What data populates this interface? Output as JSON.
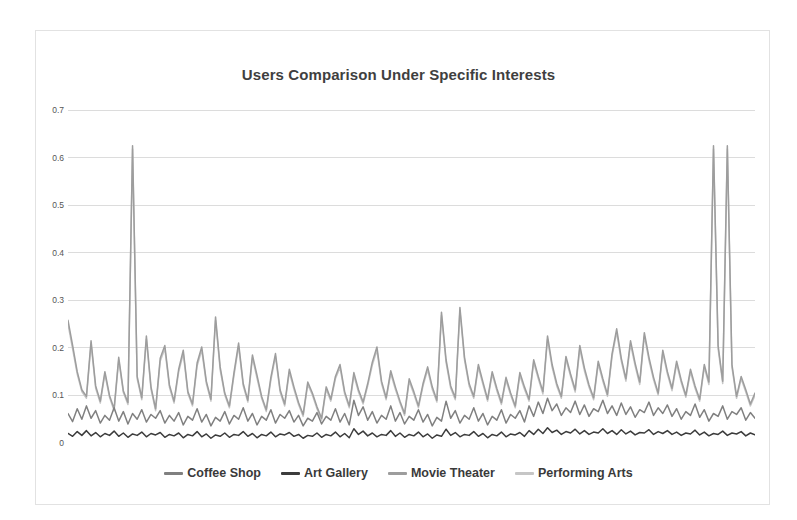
{
  "chart_data": {
    "type": "line",
    "title": "Users Comparison Under Specific Interests",
    "xlabel": "",
    "ylabel": "",
    "ylim": [
      0,
      0.7
    ],
    "yticks": [
      0,
      0.1,
      0.2,
      0.3,
      0.4,
      0.5,
      0.6,
      0.7
    ],
    "ytick_labels": [
      "0",
      "0.1",
      "0.2",
      "0.3",
      "0.4",
      "0.5",
      "0.6",
      "0.7"
    ],
    "grid": true,
    "legend_position": "bottom",
    "x_axis_visible": false,
    "n_points": 150,
    "series": [
      {
        "name": "Coffee Shop",
        "color": "#808080",
        "values": [
          0.062,
          0.045,
          0.072,
          0.05,
          0.078,
          0.052,
          0.068,
          0.042,
          0.058,
          0.048,
          0.074,
          0.046,
          0.066,
          0.04,
          0.062,
          0.05,
          0.07,
          0.044,
          0.06,
          0.052,
          0.068,
          0.042,
          0.058,
          0.046,
          0.064,
          0.038,
          0.056,
          0.048,
          0.072,
          0.044,
          0.06,
          0.036,
          0.054,
          0.046,
          0.066,
          0.04,
          0.058,
          0.05,
          0.074,
          0.046,
          0.062,
          0.038,
          0.056,
          0.048,
          0.07,
          0.042,
          0.06,
          0.052,
          0.068,
          0.044,
          0.058,
          0.036,
          0.052,
          0.046,
          0.064,
          0.04,
          0.056,
          0.048,
          0.072,
          0.044,
          0.062,
          0.038,
          0.09,
          0.058,
          0.076,
          0.048,
          0.066,
          0.042,
          0.058,
          0.05,
          0.078,
          0.046,
          0.064,
          0.04,
          0.056,
          0.048,
          0.07,
          0.044,
          0.06,
          0.036,
          0.054,
          0.046,
          0.088,
          0.052,
          0.068,
          0.042,
          0.058,
          0.05,
          0.074,
          0.046,
          0.062,
          0.038,
          0.056,
          0.048,
          0.07,
          0.042,
          0.06,
          0.052,
          0.068,
          0.044,
          0.078,
          0.056,
          0.086,
          0.062,
          0.094,
          0.068,
          0.082,
          0.058,
          0.074,
          0.064,
          0.088,
          0.06,
          0.08,
          0.056,
          0.072,
          0.066,
          0.09,
          0.062,
          0.078,
          0.058,
          0.084,
          0.06,
          0.076,
          0.054,
          0.07,
          0.064,
          0.086,
          0.058,
          0.074,
          0.062,
          0.08,
          0.056,
          0.072,
          0.05,
          0.066,
          0.058,
          0.082,
          0.054,
          0.07,
          0.046,
          0.062,
          0.056,
          0.078,
          0.05,
          0.066,
          0.06,
          0.074,
          0.048,
          0.064,
          0.052
        ]
      },
      {
        "name": "Art Gallery",
        "color": "#3c3c3c",
        "values": [
          0.02,
          0.014,
          0.024,
          0.016,
          0.026,
          0.015,
          0.022,
          0.013,
          0.02,
          0.016,
          0.025,
          0.014,
          0.021,
          0.012,
          0.019,
          0.016,
          0.023,
          0.013,
          0.02,
          0.017,
          0.022,
          0.012,
          0.018,
          0.015,
          0.021,
          0.011,
          0.018,
          0.015,
          0.024,
          0.013,
          0.019,
          0.01,
          0.017,
          0.014,
          0.021,
          0.012,
          0.018,
          0.016,
          0.024,
          0.014,
          0.02,
          0.011,
          0.018,
          0.015,
          0.023,
          0.013,
          0.019,
          0.017,
          0.022,
          0.014,
          0.018,
          0.01,
          0.016,
          0.014,
          0.021,
          0.012,
          0.018,
          0.015,
          0.023,
          0.013,
          0.02,
          0.011,
          0.03,
          0.018,
          0.025,
          0.015,
          0.021,
          0.013,
          0.018,
          0.016,
          0.026,
          0.014,
          0.021,
          0.012,
          0.018,
          0.015,
          0.023,
          0.013,
          0.019,
          0.01,
          0.017,
          0.014,
          0.029,
          0.016,
          0.022,
          0.013,
          0.018,
          0.016,
          0.024,
          0.014,
          0.02,
          0.011,
          0.018,
          0.015,
          0.023,
          0.013,
          0.019,
          0.017,
          0.022,
          0.014,
          0.026,
          0.018,
          0.029,
          0.02,
          0.032,
          0.022,
          0.027,
          0.018,
          0.024,
          0.021,
          0.029,
          0.019,
          0.026,
          0.018,
          0.023,
          0.021,
          0.03,
          0.02,
          0.026,
          0.018,
          0.028,
          0.019,
          0.025,
          0.017,
          0.022,
          0.021,
          0.028,
          0.018,
          0.024,
          0.02,
          0.026,
          0.018,
          0.023,
          0.016,
          0.021,
          0.019,
          0.027,
          0.017,
          0.023,
          0.015,
          0.02,
          0.018,
          0.025,
          0.016,
          0.021,
          0.019,
          0.024,
          0.015,
          0.021,
          0.017
        ]
      },
      {
        "name": "Movie Theater",
        "color": "#9d9d9d",
        "values": [
          0.258,
          0.205,
          0.15,
          0.112,
          0.098,
          0.215,
          0.12,
          0.088,
          0.15,
          0.1,
          0.072,
          0.18,
          0.11,
          0.085,
          0.625,
          0.14,
          0.095,
          0.225,
          0.118,
          0.072,
          0.178,
          0.205,
          0.122,
          0.088,
          0.155,
          0.195,
          0.108,
          0.082,
          0.168,
          0.202,
          0.13,
          0.092,
          0.265,
          0.16,
          0.105,
          0.078,
          0.148,
          0.21,
          0.125,
          0.09,
          0.185,
          0.142,
          0.098,
          0.07,
          0.138,
          0.188,
          0.112,
          0.082,
          0.155,
          0.118,
          0.085,
          0.06,
          0.128,
          0.105,
          0.076,
          0.052,
          0.118,
          0.092,
          0.14,
          0.165,
          0.108,
          0.078,
          0.148,
          0.112,
          0.086,
          0.125,
          0.17,
          0.202,
          0.13,
          0.095,
          0.152,
          0.118,
          0.088,
          0.062,
          0.135,
          0.108,
          0.078,
          0.125,
          0.16,
          0.118,
          0.09,
          0.275,
          0.175,
          0.12,
          0.095,
          0.285,
          0.18,
          0.125,
          0.098,
          0.165,
          0.128,
          0.092,
          0.15,
          0.115,
          0.085,
          0.138,
          0.105,
          0.078,
          0.148,
          0.118,
          0.092,
          0.175,
          0.14,
          0.108,
          0.225,
          0.165,
          0.125,
          0.098,
          0.182,
          0.145,
          0.112,
          0.205,
          0.158,
          0.122,
          0.095,
          0.172,
          0.135,
          0.102,
          0.188,
          0.24,
          0.178,
          0.135,
          0.215,
          0.168,
          0.128,
          0.232,
          0.18,
          0.138,
          0.105,
          0.195,
          0.15,
          0.115,
          0.172,
          0.132,
          0.1,
          0.155,
          0.12,
          0.092,
          0.165,
          0.128,
          0.625,
          0.205,
          0.13,
          0.625,
          0.165,
          0.098,
          0.14,
          0.112,
          0.082,
          0.105
        ]
      },
      {
        "name": "Performing Arts",
        "color": "#c6c6c6",
        "values": [
          0.25,
          0.198,
          0.145,
          0.108,
          0.094,
          0.208,
          0.115,
          0.084,
          0.145,
          0.096,
          0.068,
          0.174,
          0.106,
          0.081,
          0.618,
          0.135,
          0.091,
          0.218,
          0.113,
          0.068,
          0.172,
          0.198,
          0.117,
          0.084,
          0.149,
          0.188,
          0.104,
          0.078,
          0.162,
          0.195,
          0.125,
          0.088,
          0.258,
          0.154,
          0.101,
          0.074,
          0.142,
          0.203,
          0.12,
          0.086,
          0.179,
          0.136,
          0.094,
          0.066,
          0.132,
          0.182,
          0.107,
          0.078,
          0.149,
          0.113,
          0.081,
          0.056,
          0.123,
          0.101,
          0.072,
          0.048,
          0.113,
          0.088,
          0.135,
          0.159,
          0.103,
          0.074,
          0.142,
          0.107,
          0.082,
          0.12,
          0.164,
          0.195,
          0.125,
          0.091,
          0.146,
          0.113,
          0.084,
          0.058,
          0.13,
          0.103,
          0.074,
          0.12,
          0.154,
          0.113,
          0.086,
          0.268,
          0.169,
          0.115,
          0.091,
          0.278,
          0.174,
          0.12,
          0.094,
          0.159,
          0.123,
          0.088,
          0.145,
          0.11,
          0.081,
          0.132,
          0.101,
          0.074,
          0.142,
          0.113,
          0.088,
          0.169,
          0.135,
          0.103,
          0.218,
          0.159,
          0.12,
          0.094,
          0.176,
          0.14,
          0.107,
          0.198,
          0.152,
          0.117,
          0.091,
          0.166,
          0.13,
          0.098,
          0.182,
          0.233,
          0.172,
          0.13,
          0.208,
          0.162,
          0.123,
          0.225,
          0.174,
          0.133,
          0.101,
          0.189,
          0.145,
          0.11,
          0.166,
          0.127,
          0.096,
          0.149,
          0.115,
          0.088,
          0.159,
          0.123,
          0.618,
          0.198,
          0.125,
          0.618,
          0.159,
          0.094,
          0.135,
          0.107,
          0.078,
          0.1
        ]
      }
    ]
  },
  "styling": {
    "background": "#ffffff",
    "frame_border": "#e2e2e2",
    "gridline_color": "#dcdcdc",
    "title_color": "#3f3f3f",
    "tick_color": "#555555"
  }
}
